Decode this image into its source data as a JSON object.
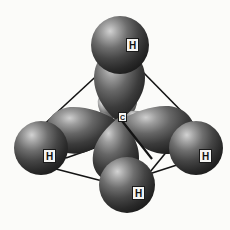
{
  "figure": {
    "title": "sp3 hybrid orbitals of methane",
    "molecule": "CH4",
    "geometry": "tetrahedral",
    "background_color": "#fbfbf9"
  },
  "colors": {
    "sphere_dark": "#2b2b2b",
    "sphere_mid": "#4a4a4a",
    "sphere_highlight": "#b9b9b9",
    "lobe_dark": "#232323",
    "lobe_mid": "#4d4d4d",
    "lobe_highlight": "#c6c6c6",
    "bond_line": "#141414",
    "label_background": "#f4f4f2",
    "label_border": "#1a1a1a",
    "label_text": "#111111"
  },
  "central_atom": {
    "symbol": "C",
    "name": "carbon",
    "x": 118,
    "y": 116
  },
  "hydrogen_atoms": [
    {
      "symbol": "H",
      "position": "top",
      "x": 120,
      "y": 45,
      "r": 29,
      "label_x": 126,
      "label_y": 41
    },
    {
      "symbol": "H",
      "position": "left",
      "x": 41,
      "y": 148,
      "r": 27,
      "label_x": 44,
      "label_y": 150
    },
    {
      "symbol": "H",
      "position": "right",
      "x": 196,
      "y": 148,
      "r": 27,
      "label_x": 199,
      "label_y": 150
    },
    {
      "symbol": "H",
      "position": "bottom",
      "x": 127,
      "y": 184,
      "r": 28,
      "label_x": 132,
      "label_y": 185
    }
  ],
  "orbital_lobes": [
    {
      "name": "lobe-top",
      "direction": "up"
    },
    {
      "name": "lobe-left",
      "direction": "left"
    },
    {
      "name": "lobe-right",
      "direction": "right"
    },
    {
      "name": "lobe-bottom",
      "direction": "down-front"
    }
  ],
  "back_lobes": [
    {
      "name": "back-lobe-upper-left"
    },
    {
      "name": "back-lobe-upper-right"
    },
    {
      "name": "back-lobe-left"
    },
    {
      "name": "back-lobe-right"
    },
    {
      "name": "back-lobe-lower"
    }
  ],
  "bond_edges": [
    {
      "name": "edge-top-left",
      "x1": 105,
      "y1": 70,
      "x2": 40,
      "y2": 128
    },
    {
      "name": "edge-top-right",
      "x1": 139,
      "y1": 68,
      "x2": 196,
      "y2": 127
    },
    {
      "name": "edge-left-bottom",
      "x1": 58,
      "y1": 168,
      "x2": 112,
      "y2": 182
    },
    {
      "name": "edge-right-bottom",
      "x1": 178,
      "y1": 164,
      "x2": 148,
      "y2": 176
    },
    {
      "name": "edge-center-left",
      "x1": 98,
      "y1": 146,
      "x2": 72,
      "y2": 156
    },
    {
      "name": "edge-center-back",
      "x1": 105,
      "y1": 134,
      "x2": 105,
      "y2": 162
    },
    {
      "name": "edge-c-to-bottom",
      "x1": 120,
      "y1": 118,
      "x2": 150,
      "y2": 160
    }
  ]
}
